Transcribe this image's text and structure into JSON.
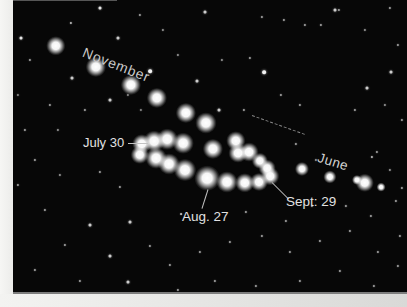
{
  "photo": {
    "colors": {
      "sky_background": "#070707",
      "planet_dot": "#ffffff",
      "label_text": "#e2e2e2",
      "margin_white": "#f3f3f1",
      "photo_edge_line": "#7d7d7d",
      "dashed_trail": "#8f8f8f"
    },
    "annotations": {
      "november": {
        "text": "November"
      },
      "july_30": {
        "text": "July 30"
      },
      "aug_27": {
        "text": "Aug. 27"
      },
      "sept_29": {
        "text": "Sept: 29"
      },
      "june": {
        "text": "June"
      }
    },
    "pointer_lines": [
      {
        "name": "july30-pointer-line",
        "x1": 128,
        "y1": 143,
        "x2": 148,
        "y2": 143,
        "dashed": false
      },
      {
        "name": "aug27-pointer-line",
        "x1": 208,
        "y1": 189,
        "x2": 202,
        "y2": 208,
        "dashed": false
      },
      {
        "name": "sept29-pointer-line",
        "x1": 272,
        "y1": 182,
        "x2": 288,
        "y2": 198,
        "dashed": false
      },
      {
        "name": "faint-dashed-trail",
        "x1": 252,
        "y1": 115,
        "x2": 305,
        "y2": 134,
        "dashed": true
      }
    ],
    "planet_positions": {
      "november_trail": [
        [
          56,
          46,
          4.4
        ],
        [
          96,
          67,
          4.6
        ],
        [
          131,
          85,
          4.6
        ],
        [
          157,
          98,
          4.6
        ],
        [
          186,
          113,
          4.6
        ],
        [
          206,
          123,
          4.8
        ]
      ],
      "retrograde_loop": [
        [
          236,
          141,
          4.4
        ],
        [
          249,
          152,
          4.3
        ],
        [
          238,
          153,
          4.3
        ],
        [
          260,
          161,
          3.7
        ],
        [
          267,
          168,
          3.8
        ],
        [
          270,
          176,
          4.0
        ],
        [
          259,
          182,
          4.1
        ],
        [
          245,
          183,
          4.4
        ],
        [
          227,
          182,
          4.8
        ],
        [
          207,
          178,
          5.6
        ],
        [
          185,
          170,
          5.0
        ],
        [
          169,
          164,
          4.8
        ],
        [
          156,
          158,
          4.7
        ],
        [
          140,
          155,
          4.2
        ],
        [
          142,
          144,
          4.4
        ],
        [
          154,
          141,
          4.7
        ],
        [
          167,
          139,
          4.7
        ],
        [
          183,
          143,
          4.7
        ],
        [
          213,
          149,
          4.6
        ]
      ],
      "june_trail": [
        [
          302,
          169,
          3.2
        ],
        [
          330,
          177,
          3.0
        ],
        [
          357,
          180,
          2.3
        ],
        [
          365,
          183,
          4.2
        ],
        [
          381,
          187,
          2.0
        ]
      ]
    },
    "stars": [
      [
        100,
        8,
        2,
        0.9
      ],
      [
        140,
        15,
        1.5,
        0.6
      ],
      [
        205,
        12,
        2,
        0.8
      ],
      [
        262,
        17,
        1.5,
        0.6
      ],
      [
        305,
        25,
        1.5,
        0.6
      ],
      [
        335,
        10,
        2,
        0.8
      ],
      [
        390,
        8,
        1.5,
        0.6
      ],
      [
        365,
        30,
        1.5,
        0.55
      ],
      [
        398,
        45,
        1.5,
        0.6
      ],
      [
        21,
        38,
        2,
        0.9
      ],
      [
        71,
        23,
        1.5,
        0.7
      ],
      [
        118,
        38,
        2,
        0.8
      ],
      [
        30,
        60,
        1.5,
        0.6
      ],
      [
        150,
        71,
        2.5,
        0.95
      ],
      [
        197,
        81,
        2,
        0.8
      ],
      [
        72,
        78,
        2,
        0.8
      ],
      [
        264,
        72,
        2.5,
        0.95
      ],
      [
        284,
        20,
        1.5,
        0.6
      ],
      [
        321,
        25,
        1.5,
        0.6
      ],
      [
        339,
        10,
        1.5,
        0.6
      ],
      [
        391,
        72,
        2,
        0.8
      ],
      [
        367,
        88,
        2,
        0.8
      ],
      [
        50,
        105,
        1.5,
        0.6
      ],
      [
        25,
        130,
        1.5,
        0.6
      ],
      [
        85,
        110,
        1.5,
        0.6
      ],
      [
        110,
        100,
        2,
        0.8
      ],
      [
        219,
        110,
        2,
        0.8
      ],
      [
        244,
        110,
        1.5,
        0.6
      ],
      [
        300,
        105,
        1.5,
        0.6
      ],
      [
        355,
        110,
        1.5,
        0.6
      ],
      [
        385,
        105,
        1.5,
        0.55
      ],
      [
        402,
        120,
        1.5,
        0.6
      ],
      [
        35,
        160,
        1.5,
        0.6
      ],
      [
        18,
        185,
        1.5,
        0.6
      ],
      [
        60,
        175,
        1.5,
        0.55
      ],
      [
        100,
        172,
        1.5,
        0.6
      ],
      [
        120,
        187,
        1.5,
        0.6
      ],
      [
        45,
        210,
        1.5,
        0.6
      ],
      [
        90,
        225,
        2,
        0.8
      ],
      [
        130,
        222,
        2,
        0.8
      ],
      [
        65,
        245,
        1.5,
        0.6
      ],
      [
        110,
        256,
        2,
        0.8
      ],
      [
        150,
        246,
        1.5,
        0.6
      ],
      [
        35,
        270,
        1.5,
        0.6
      ],
      [
        80,
        281,
        1.5,
        0.6
      ],
      [
        128,
        282,
        2,
        0.8
      ],
      [
        170,
        265,
        1.5,
        0.6
      ],
      [
        200,
        252,
        1.5,
        0.6
      ],
      [
        230,
        242,
        1.5,
        0.6
      ],
      [
        262,
        236,
        1.5,
        0.6
      ],
      [
        290,
        252,
        1.5,
        0.6
      ],
      [
        320,
        241,
        1.5,
        0.6
      ],
      [
        350,
        231,
        1.5,
        0.6
      ],
      [
        378,
        252,
        1.5,
        0.6
      ],
      [
        400,
        236,
        1.5,
        0.6
      ],
      [
        178,
        290,
        1.5,
        0.6
      ],
      [
        215,
        281,
        1.5,
        0.6
      ],
      [
        256,
        286,
        1.5,
        0.6
      ],
      [
        300,
        281,
        1.5,
        0.6
      ],
      [
        340,
        271,
        1.5,
        0.6
      ],
      [
        374,
        286,
        1.5,
        0.6
      ],
      [
        398,
        266,
        1.5,
        0.6
      ],
      [
        246,
        212,
        1.5,
        0.6
      ],
      [
        286,
        221,
        1.5,
        0.6
      ],
      [
        312,
        206,
        1.5,
        0.6
      ],
      [
        346,
        206,
        1.5,
        0.6
      ],
      [
        371,
        216,
        1.5,
        0.6
      ],
      [
        396,
        201,
        1.5,
        0.6
      ],
      [
        316,
        160,
        1.5,
        0.55
      ],
      [
        296,
        144,
        1.5,
        0.6
      ],
      [
        372,
        157,
        1.5,
        0.7
      ],
      [
        377,
        152,
        1.5,
        0.6
      ],
      [
        390,
        170,
        1.5,
        0.55
      ],
      [
        402,
        188,
        1.5,
        0.6
      ],
      [
        222,
        60,
        1.5,
        0.55
      ],
      [
        250,
        58,
        1.5,
        0.6
      ],
      [
        281,
        95,
        1.5,
        0.6
      ],
      [
        163,
        30,
        1.5,
        0.55
      ],
      [
        178,
        55,
        1.5,
        0.55
      ],
      [
        58,
        130,
        1.5,
        0.55
      ],
      [
        18,
        95,
        1.5,
        0.5
      ],
      [
        128,
        95,
        1.5,
        0.5
      ],
      [
        141,
        110,
        1.5,
        0.5
      ],
      [
        181,
        214,
        1.2,
        0.7
      ]
    ]
  }
}
